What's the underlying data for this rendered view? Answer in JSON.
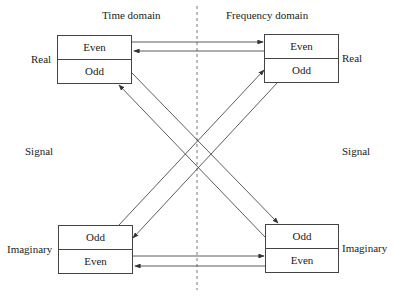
{
  "headers": {
    "time_domain": "Time domain",
    "frequency_domain": "Frequency domain"
  },
  "side_labels": {
    "left_real": "Real",
    "left_signal": "Signal",
    "left_imaginary": "Imaginary",
    "right_real": "Real",
    "right_signal": "Signal",
    "right_imaginary": "Imaginary"
  },
  "boxes": {
    "time_real": {
      "top": "Even",
      "bottom": "Odd"
    },
    "freq_real": {
      "top": "Even",
      "bottom": "Odd"
    },
    "time_imag": {
      "top": "Odd",
      "bottom": "Even"
    },
    "freq_imag": {
      "top": "Odd",
      "bottom": "Even"
    }
  },
  "colors": {
    "line": "#444444",
    "background": "#ffffff"
  }
}
